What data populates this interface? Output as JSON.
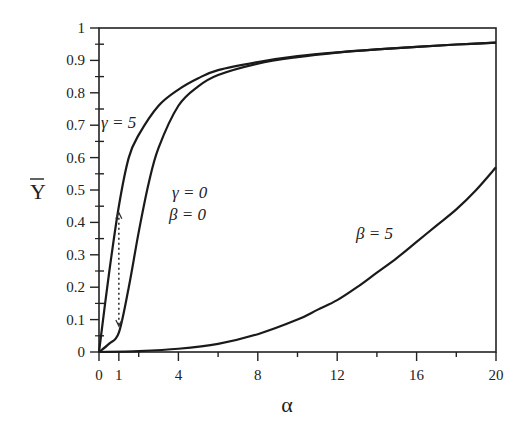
{
  "chart_data": {
    "type": "line",
    "title": "",
    "xlabel": "α",
    "ylabel": "Ȳ",
    "xlim": [
      0,
      20
    ],
    "ylim": [
      0,
      1
    ],
    "grid": false,
    "legend": "none (inline curve annotations)",
    "x_ticks": [
      "0",
      "1",
      "4",
      "8",
      "12",
      "16",
      "20"
    ],
    "x_tick_values": [
      0,
      1,
      4,
      8,
      12,
      16,
      20
    ],
    "y_ticks": [
      "0",
      "0.1",
      "0.2",
      "0.3",
      "0.4",
      "0.5",
      "0.6",
      "0.7",
      "0.8",
      "0.9",
      "1"
    ],
    "y_tick_values": [
      0,
      0.1,
      0.2,
      0.3,
      0.4,
      0.5,
      0.6,
      0.7,
      0.8,
      0.9,
      1
    ],
    "series": [
      {
        "name": "γ = 5",
        "x": [
          0,
          0.5,
          1,
          1.5,
          2,
          3,
          4,
          5,
          6,
          8,
          10,
          12,
          14,
          16,
          18,
          20
        ],
        "values": [
          0,
          0.24,
          0.45,
          0.6,
          0.67,
          0.76,
          0.81,
          0.845,
          0.87,
          0.895,
          0.913,
          0.925,
          0.934,
          0.942,
          0.949,
          0.955
        ]
      },
      {
        "name": "γ = 0, β = 0",
        "x": [
          0,
          0.5,
          1,
          1.5,
          2,
          2.5,
          3,
          4,
          5,
          6,
          8,
          10,
          12,
          14,
          16,
          18,
          20
        ],
        "values": [
          0,
          0.025,
          0.06,
          0.2,
          0.37,
          0.52,
          0.63,
          0.76,
          0.82,
          0.855,
          0.89,
          0.91,
          0.924,
          0.934,
          0.942,
          0.949,
          0.955
        ]
      },
      {
        "name": "β = 5",
        "x": [
          0,
          2,
          4,
          6,
          8,
          10,
          11,
          12,
          13,
          14,
          15,
          16,
          17,
          18,
          19,
          20
        ],
        "values": [
          0,
          0.003,
          0.01,
          0.025,
          0.055,
          0.1,
          0.13,
          0.16,
          0.2,
          0.245,
          0.29,
          0.34,
          0.39,
          0.44,
          0.5,
          0.57
        ]
      }
    ],
    "annotations": [
      {
        "text": "γ = 5",
        "x": 0.6,
        "y": 0.7
      },
      {
        "text": "γ = 0",
        "x": 3.5,
        "y": 0.55
      },
      {
        "text": "β = 0",
        "x": 3.5,
        "y": 0.48
      },
      {
        "text": "β = 5",
        "x": 10.5,
        "y": 0.28
      },
      {
        "text": "dotted double arrow at α = 1 between curves",
        "x": 1,
        "y_from": 0.06,
        "y_to": 0.45
      }
    ]
  },
  "labels": {
    "xlabel": "α",
    "ylabel": "Y",
    "gamma5": "γ = 5",
    "gamma0": "γ = 0",
    "beta0": "β = 0",
    "beta5": "β = 5"
  }
}
